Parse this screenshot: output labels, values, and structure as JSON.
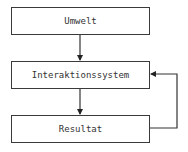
{
  "diagram": {
    "nodes": [
      {
        "id": "umwelt",
        "label": "Umwelt"
      },
      {
        "id": "interaktionssystem",
        "label": "Interaktionssystem"
      },
      {
        "id": "resultat",
        "label": "Resultat"
      }
    ],
    "edges": [
      {
        "from": "umwelt",
        "to": "interaktionssystem"
      },
      {
        "from": "interaktionssystem",
        "to": "resultat"
      },
      {
        "from": "resultat",
        "to": "interaktionssystem",
        "type": "feedback"
      }
    ],
    "colors": {
      "stroke": "#3a3a3a",
      "text": "#333333",
      "background": "#ffffff"
    }
  }
}
